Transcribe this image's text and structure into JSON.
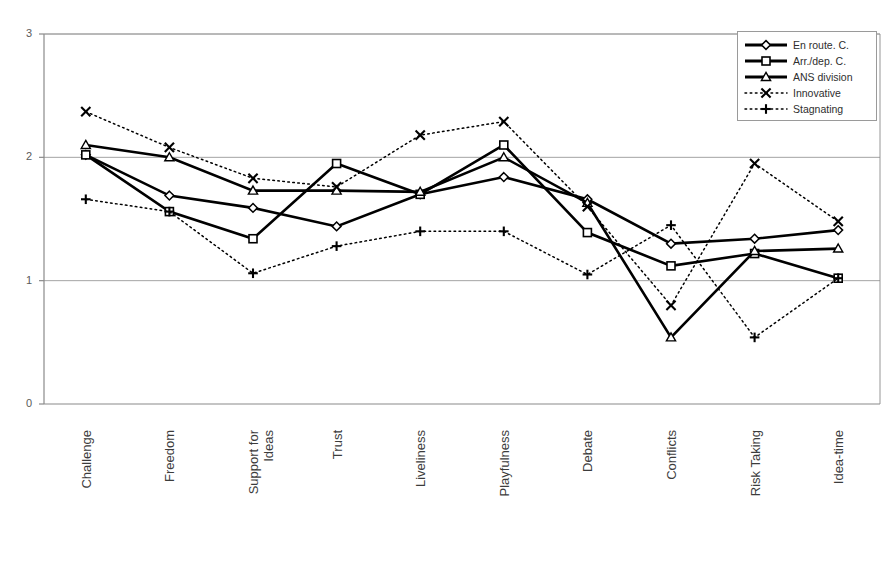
{
  "chart_data": {
    "type": "line",
    "title": "",
    "subtitle": "",
    "xlabel": "",
    "ylabel": "",
    "ylim": [
      0,
      3
    ],
    "yticks": [
      0,
      1,
      2,
      3
    ],
    "ytick_labels": [
      "0",
      "1",
      "2",
      "3"
    ],
    "grid": true,
    "grid_axis": "y",
    "legend_position": "top-right",
    "categories": [
      "Challenge",
      "Freedom",
      "Support for\nIdeas",
      "Trust",
      "Liveliness",
      "Playfulness",
      "Debate",
      "Conflicts",
      "Risk Taking",
      "Idea-time"
    ],
    "series": [
      {
        "name": "En route. C.",
        "marker": "diamond",
        "linestyle": "solid",
        "color": "#000000",
        "values": [
          2.02,
          1.69,
          1.59,
          1.44,
          1.7,
          1.84,
          1.66,
          1.3,
          1.34,
          1.41
        ]
      },
      {
        "name": "Arr./dep. C.",
        "marker": "square",
        "linestyle": "solid",
        "color": "#000000",
        "values": [
          2.02,
          1.56,
          1.34,
          1.95,
          1.7,
          2.1,
          1.39,
          1.12,
          1.22,
          1.02
        ]
      },
      {
        "name": "ANS division",
        "marker": "triangle",
        "linestyle": "solid",
        "color": "#000000",
        "values": [
          2.1,
          2.0,
          1.73,
          1.73,
          1.72,
          2.0,
          1.63,
          0.54,
          1.24,
          1.26
        ]
      },
      {
        "name": "Innovative",
        "marker": "cross-x",
        "linestyle": "dotted",
        "color": "#000000",
        "values": [
          2.37,
          2.08,
          1.83,
          1.76,
          2.18,
          2.29,
          1.6,
          0.8,
          1.95,
          1.48
        ]
      },
      {
        "name": "Stagnating",
        "marker": "plus",
        "linestyle": "dotted",
        "color": "#000000",
        "values": [
          1.66,
          1.56,
          1.06,
          1.28,
          1.4,
          1.4,
          1.05,
          1.45,
          0.54,
          1.02
        ]
      }
    ]
  },
  "axes": {
    "plot_left": 44,
    "plot_right": 880,
    "plot_top": 34,
    "plot_bottom": 404
  },
  "legend": {
    "entries": [
      {
        "label": "En route. C.",
        "icon": "diamond-marker-icon"
      },
      {
        "label": "Arr./dep. C.",
        "icon": "square-marker-icon"
      },
      {
        "label": "ANS division",
        "icon": "triangle-marker-icon"
      },
      {
        "label": "Innovative",
        "icon": "x-marker-icon"
      },
      {
        "label": "Stagnating",
        "icon": "plus-marker-icon"
      }
    ]
  },
  "colors": {
    "ink": "#000000",
    "axis": "#8a8a8a",
    "grid": "#9a9a9a",
    "text": "#3c3c3c",
    "background": "#ffffff"
  }
}
